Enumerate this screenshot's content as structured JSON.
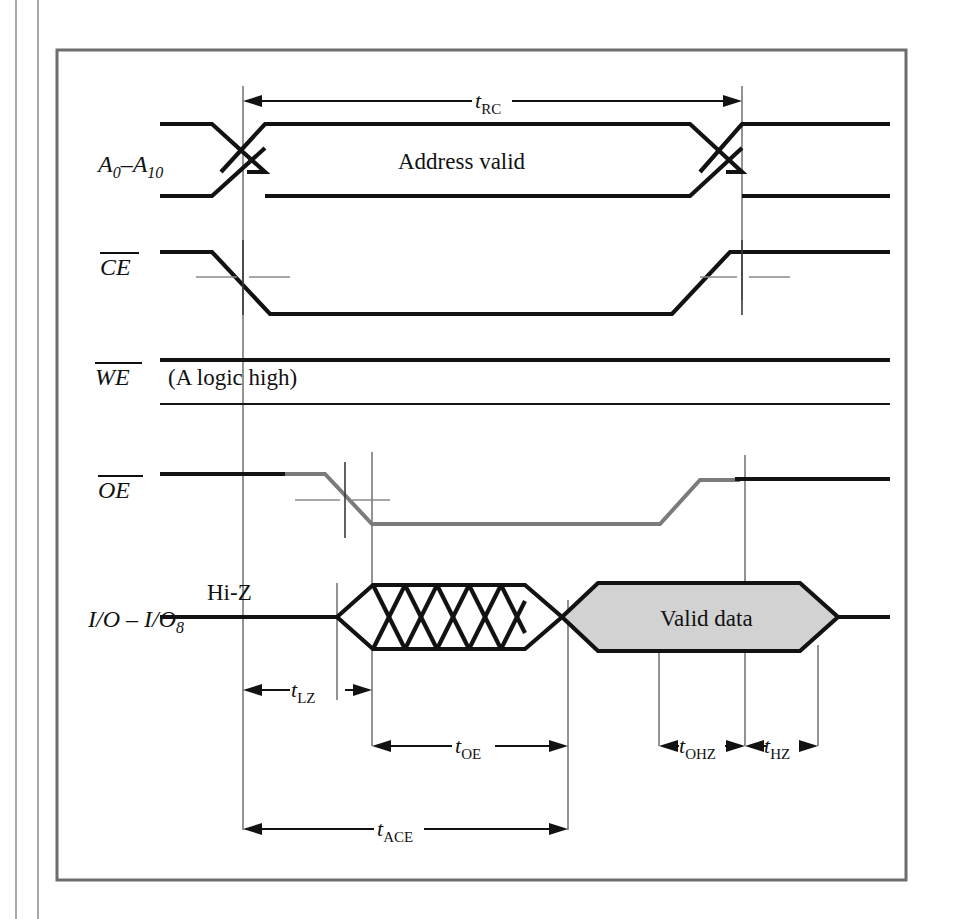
{
  "figure": {
    "background_color": "#ffffff",
    "frame_color": "#6d6d6d",
    "signal_color": "#121212",
    "oe_trace_color": "#7b7b7b",
    "valid_data_fill": "#d2d2d2",
    "reference_line_color": "#6f6f6f"
  },
  "signals": [
    {
      "id": "address",
      "name": "A0-A10",
      "label_main": "A",
      "label_sub1": "0",
      "label_dash": "–",
      "label_main2": "A",
      "label_sub2": "10",
      "overbar": false,
      "annotation": "Address valid"
    },
    {
      "id": "ce",
      "name": "CE",
      "label_main": "CE",
      "overbar": true,
      "annotation": ""
    },
    {
      "id": "we",
      "name": "WE",
      "label_main": "WE",
      "overbar": true,
      "annotation": "(A logic high)"
    },
    {
      "id": "oe",
      "name": "OE",
      "label_main": "OE",
      "overbar": true,
      "annotation": ""
    },
    {
      "id": "io",
      "name": "I/O - I/O8",
      "label_main": "I/O",
      "label_dash": "–",
      "label_main2": "I/O",
      "label_sub2": "8",
      "overbar": false,
      "annotation_left": "Hi-Z",
      "annotation_right": "Valid data"
    }
  ],
  "measurements": [
    {
      "id": "trc",
      "symbol": "t",
      "subscript": "RC",
      "position": "top",
      "arrow_style": "outward-both"
    },
    {
      "id": "tlz",
      "symbol": "t",
      "subscript": "LZ",
      "position": "io-lower-1",
      "arrow_style": "outward-both"
    },
    {
      "id": "toe",
      "symbol": "t",
      "subscript": "OE",
      "position": "io-lower-2",
      "arrow_style": "outward-both"
    },
    {
      "id": "tohz",
      "symbol": "t",
      "subscript": "OHZ",
      "position": "io-lower-2-r",
      "arrow_style": "inward-both"
    },
    {
      "id": "thz",
      "symbol": "t",
      "subscript": "HZ",
      "position": "io-lower-2-r",
      "arrow_style": "inward-both"
    },
    {
      "id": "tace",
      "symbol": "t",
      "subscript": "ACE",
      "position": "bottom",
      "arrow_style": "outward-both"
    }
  ],
  "annotations": {
    "address_valid": "Address valid",
    "we_logic_high": "(A logic high)",
    "hi_z": "Hi-Z",
    "valid_data": "Valid data"
  }
}
